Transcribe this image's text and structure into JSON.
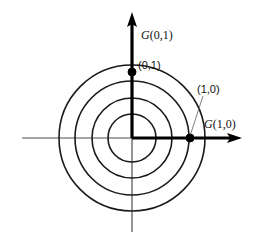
{
  "figure": {
    "background_color": "#ffffff",
    "stroke_color": "#1a1a1a",
    "axis_color": "#4d4d4d",
    "arrow_color": "#000000",
    "leader_color": "#6e6e6e"
  },
  "chart_data": {
    "type": "scatter",
    "title": "",
    "xlabel": "",
    "ylabel": "",
    "grid": false,
    "legend_position": "none",
    "center": {
      "x": 132,
      "y": 138
    },
    "circles": [
      {
        "name": "circle-1-innermost",
        "radius": 24
      },
      {
        "name": "circle-2",
        "radius": 40
      },
      {
        "name": "circle-3",
        "radius": 57
      },
      {
        "name": "circle-4-outermost",
        "radius": 73
      }
    ],
    "points": [
      {
        "name": "point-0-1",
        "label": "(0,1)",
        "x": 132,
        "y": 72
      },
      {
        "name": "point-1-0",
        "label": "(1,0)",
        "x": 190,
        "y": 138
      }
    ],
    "axes": [
      {
        "name": "x-axis",
        "label": "G(1,0)",
        "direction": "horizontal"
      },
      {
        "name": "y-axis",
        "label": "G(0,1)",
        "direction": "vertical"
      }
    ]
  },
  "labels": {
    "y_axis_generator_italic": "G",
    "y_axis_generator_rest": "(0,1)",
    "x_axis_generator_italic": "G",
    "x_axis_generator_rest": "(1,0)",
    "point_top": "(0,1)",
    "point_right": "(1,0)"
  }
}
